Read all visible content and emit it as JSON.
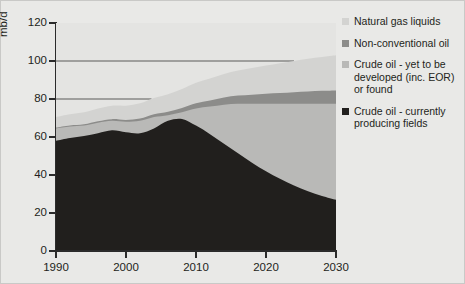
{
  "chart_data": {
    "type": "area",
    "stacked": true,
    "title": "",
    "xlabel": "",
    "ylabel": "mb/d",
    "xlim": [
      1990,
      2030
    ],
    "ylim": [
      0,
      120
    ],
    "grid": true,
    "gridlines_y": [
      20,
      40,
      60,
      80,
      100,
      120
    ],
    "x_ticks": [
      "1990",
      "2000",
      "2010",
      "2020",
      "2030"
    ],
    "y_ticks": [
      "0",
      "20",
      "40",
      "60",
      "80",
      "100",
      "120"
    ],
    "legend_position": "right",
    "x": [
      1990,
      1992,
      1994,
      1996,
      1998,
      2000,
      2002,
      2004,
      2006,
      2008,
      2010,
      2012,
      2014,
      2016,
      2018,
      2020,
      2022,
      2024,
      2026,
      2028,
      2030
    ],
    "series": [
      {
        "name": "Crude oil - currently producing fields",
        "color": "#211f1d",
        "values": [
          58.0,
          59.5,
          60.5,
          62.0,
          63.5,
          62.5,
          62.0,
          64.5,
          68.5,
          69.5,
          66.0,
          61.5,
          56.5,
          51.5,
          46.5,
          42.0,
          38.0,
          34.5,
          31.5,
          29.0,
          27.0
        ]
      },
      {
        "name": "Crude oil - yet to be developed (inc. EOR) or found",
        "color": "#b9b9b7",
        "values": [
          6.5,
          6.0,
          5.5,
          5.5,
          5.0,
          5.5,
          6.5,
          6.0,
          3.0,
          3.5,
          9.0,
          14.5,
          20.5,
          26.0,
          31.0,
          35.5,
          39.5,
          43.0,
          46.0,
          48.5,
          50.5
        ]
      },
      {
        "name": "Non-conventional oil",
        "color": "#8c8c8a",
        "values": [
          0.5,
          0.6,
          0.7,
          0.8,
          0.9,
          1.0,
          1.2,
          1.5,
          1.8,
          2.2,
          2.7,
          3.2,
          3.8,
          4.3,
          4.8,
          5.3,
          5.7,
          6.1,
          6.5,
          6.8,
          7.0
        ]
      },
      {
        "name": "Natural gas liquids",
        "color": "#d3d3d1",
        "values": [
          5.5,
          5.9,
          6.3,
          6.7,
          7.1,
          7.5,
          8.0,
          8.5,
          9.2,
          10.0,
          10.8,
          11.6,
          12.4,
          13.2,
          14.0,
          14.8,
          15.6,
          16.4,
          17.2,
          17.8,
          18.5
        ]
      }
    ]
  },
  "axis": {
    "y_title": "mb/d",
    "y_ticks": [
      "120",
      "100",
      "80",
      "60",
      "40",
      "20",
      "0"
    ],
    "x_ticks": [
      "1990",
      "2000",
      "2010",
      "2020",
      "2030"
    ]
  },
  "legend": {
    "items": [
      {
        "label": "Natural gas liquids",
        "color": "#d3d3d1"
      },
      {
        "label": "Non-conventional oil",
        "color": "#8c8c8a"
      },
      {
        "label": "Crude oil - yet to be developed (inc. EOR) or found",
        "color": "#b9b9b7"
      },
      {
        "label": "Crude oil - currently producing fields",
        "color": "#211f1d"
      }
    ]
  },
  "colors": {
    "figure_background": "#e9e9e7",
    "plot_background": "#e4e4e2",
    "axis": "#2b2b2b",
    "gridline": "#5a5a58",
    "text": "#231f20"
  }
}
